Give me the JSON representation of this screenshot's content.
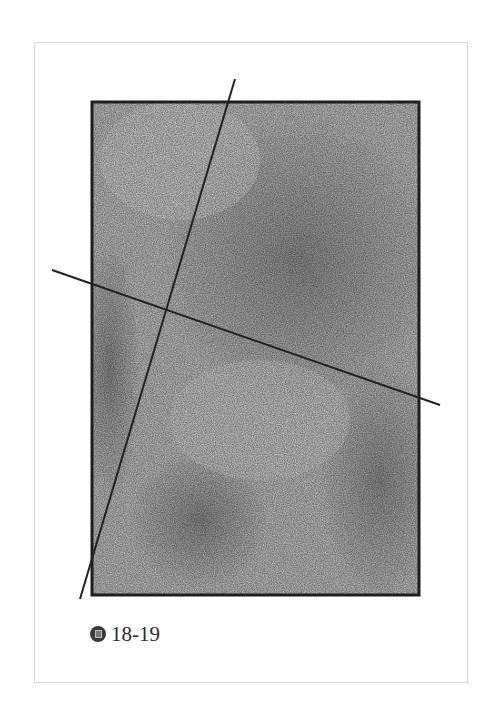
{
  "figure": {
    "caption_icon": "figure-badge-icon",
    "caption_label": "18-19",
    "colors": {
      "frame_border": "#d8d8d8",
      "rect_border": "#1e1e1e",
      "shading_light": "#cfcfcf",
      "shading_dark": "#8a8a8a",
      "line": "#222222"
    }
  }
}
